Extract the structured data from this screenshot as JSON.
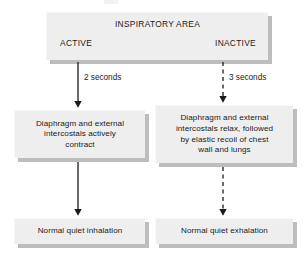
{
  "diagram": {
    "type": "flowchart",
    "title": "INSPIRATORY AREA",
    "orientation": "top-down, two parallel branches",
    "background_color": "#ffffff",
    "box_fill_color": "#eeeeee",
    "box_shadow_color": "#bdbdbd",
    "text_color": "#1a1a1a",
    "header": {
      "title": "INSPIRATORY AREA",
      "left_state": "ACTIVE",
      "right_state": "INACTIVE"
    },
    "branches": [
      {
        "id": "inspiration",
        "state": "ACTIVE",
        "connector_label": "2 seconds",
        "connector_style": "solid",
        "mechanism": "Diaphragm and external intercostals actively contract",
        "outcome": "Normal quiet inhalation"
      },
      {
        "id": "expiration",
        "state": "INACTIVE",
        "connector_label": "3 seconds",
        "connector_style": "dashed",
        "mechanism": "Diaphragm and external intercostals relax, followed by elastic recoil of chest wall and lungs",
        "outcome": "Normal quiet exhalation"
      }
    ],
    "labels": {
      "duration_left": "2 seconds",
      "duration_right": "3 seconds",
      "mechanism_left": "Diaphragm and external\nintercostals actively\ncontract",
      "mechanism_right": "Diaphragm and external\nintercostals relax, followed\nby elastic recoil of chest\nwall and lungs",
      "outcome_left": "Normal quiet inhalation",
      "outcome_right": "Normal quiet exhalation"
    }
  }
}
